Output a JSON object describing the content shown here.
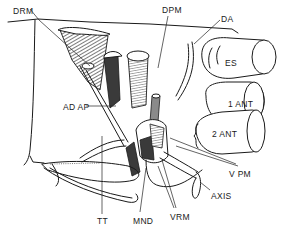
{
  "figure": {
    "background": "#ffffff",
    "ink": "#1a1a1a"
  },
  "labels": [
    {
      "id": "drm",
      "text": "DRM",
      "x": 13,
      "y": 7
    },
    {
      "id": "dpm",
      "text": "DPM",
      "x": 162,
      "y": 7
    },
    {
      "id": "da",
      "text": "DA",
      "x": 221,
      "y": 16
    },
    {
      "id": "es",
      "text": "ES",
      "x": 225,
      "y": 60
    },
    {
      "id": "ant1",
      "text": "1 ANT",
      "x": 228,
      "y": 101
    },
    {
      "id": "adap",
      "text": "AD AP",
      "x": 65,
      "y": 104
    },
    {
      "id": "ant2",
      "text": "2 ANT",
      "x": 212,
      "y": 131
    },
    {
      "id": "vpm",
      "text": "V PM",
      "x": 230,
      "y": 171
    },
    {
      "id": "axis",
      "text": "AXIS",
      "x": 212,
      "y": 193
    },
    {
      "id": "tt",
      "text": "TT",
      "x": 98,
      "y": 218
    },
    {
      "id": "mnd",
      "text": "MND",
      "x": 134,
      "y": 218
    },
    {
      "id": "vrm",
      "text": "VRM",
      "x": 170,
      "y": 214
    }
  ]
}
